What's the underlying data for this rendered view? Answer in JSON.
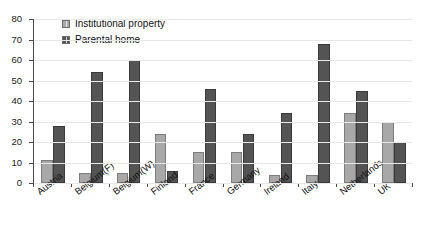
{
  "title_sliver": "",
  "legend": {
    "position": "top-left-inside",
    "entries": [
      {
        "label": "Institutional property",
        "color": "#a8a8a8",
        "icon": "legend-swatch-icon"
      },
      {
        "label": "Parental home",
        "color": "#545454",
        "icon": "legend-swatch-icon"
      }
    ]
  },
  "axes": {
    "y_ticks": [
      "0",
      "10",
      "20",
      "30",
      "40",
      "50",
      "60",
      "70",
      "80"
    ],
    "x_categories": [
      "Austria",
      "Belgium(F)",
      "Belgium(W)",
      "Finland",
      "France",
      "Germany",
      "Ireland",
      "Italy",
      "Netherlands",
      "UK"
    ]
  },
  "chart_data": {
    "type": "bar",
    "title": "",
    "xlabel": "",
    "ylabel": "",
    "ylim": [
      0,
      80
    ],
    "ytick_step": 10,
    "grid": false,
    "legend_position": "upper left",
    "bar_orientation": "vertical",
    "grouping": "grouped",
    "categories": [
      "Austria",
      "Belgium(F)",
      "Belgium(W)",
      "Finland",
      "France",
      "Germany",
      "Ireland",
      "Italy",
      "Netherlands",
      "UK"
    ],
    "series": [
      {
        "name": "Institutional property",
        "color": "#a8a8a8",
        "values": [
          11,
          5,
          5,
          24,
          15,
          15,
          4,
          4,
          34,
          30
        ]
      },
      {
        "name": "Parental home",
        "color": "#545454",
        "values": [
          28,
          54,
          60,
          6,
          46,
          24,
          34,
          68,
          45,
          20
        ]
      }
    ]
  }
}
